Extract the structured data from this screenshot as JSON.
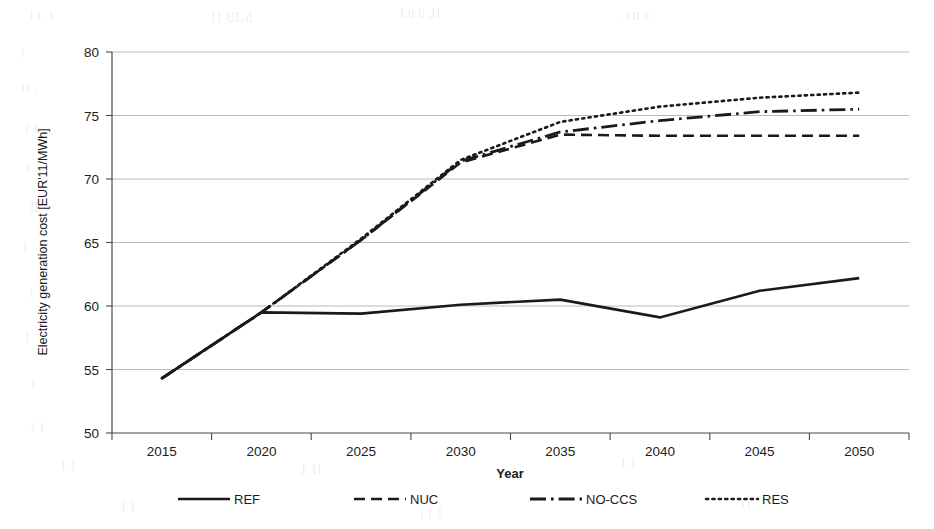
{
  "chart_data": {
    "type": "line",
    "title": "",
    "xlabel": "Year",
    "ylabel": "Electricity generation cost [EUR'11/MWh]",
    "categories": [
      2015,
      2020,
      2025,
      2030,
      2035,
      2040,
      2045,
      2050
    ],
    "x_tick_labels": [
      "2015",
      "2020",
      "2025",
      "2030",
      "2035",
      "2040",
      "2045",
      "2050"
    ],
    "y_tick_labels": [
      "50",
      "55",
      "60",
      "65",
      "70",
      "75",
      "80"
    ],
    "y_ticks": [
      50,
      55,
      60,
      65,
      70,
      75,
      80
    ],
    "ylim": [
      50,
      80
    ],
    "grid": "horizontal",
    "legend_position": "bottom",
    "series": [
      {
        "name": "REF",
        "style": "solid",
        "color": "#1a1a1a",
        "values": [
          54.3,
          59.5,
          59.4,
          60.1,
          60.5,
          59.1,
          61.2,
          62.2
        ]
      },
      {
        "name": "NUC",
        "style": "dashed",
        "color": "#1a1a1a",
        "values": [
          54.3,
          59.5,
          65.2,
          71.3,
          73.5,
          73.4,
          73.4,
          73.4
        ]
      },
      {
        "name": "NO-CCS",
        "style": "dashdot",
        "color": "#1a1a1a",
        "values": [
          54.3,
          59.5,
          65.2,
          71.4,
          73.7,
          74.6,
          75.3,
          75.5
        ]
      },
      {
        "name": "RES",
        "style": "dotted",
        "color": "#1a1a1a",
        "values": [
          54.3,
          59.5,
          65.3,
          71.5,
          74.5,
          75.7,
          76.4,
          76.8
        ]
      }
    ]
  },
  "legend": {
    "items": [
      {
        "label": "REF",
        "style": "solid"
      },
      {
        "label": "NUC",
        "style": "dashed"
      },
      {
        "label": "NO-CCS",
        "style": "dashdot"
      },
      {
        "label": "RES",
        "style": "dotted"
      }
    ]
  },
  "axes": {
    "x_title": "Year",
    "y_title": "Electricity generation cost [EUR'11/MWh]"
  }
}
